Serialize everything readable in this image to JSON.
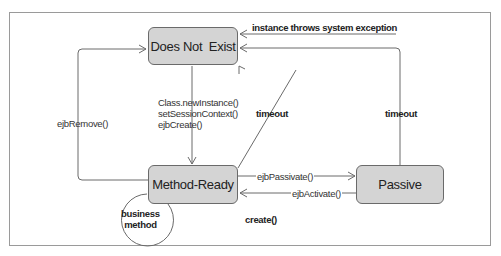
{
  "diagram": {
    "states": [
      {
        "id": "does_not_exist",
        "label": "Does Not  Exist"
      },
      {
        "id": "method_ready",
        "label": "Method-Ready"
      },
      {
        "id": "passive",
        "label": "Passive"
      }
    ],
    "transitions": {
      "create": "Class.newInstance()\nsetSessionContext()\nejbCreate()",
      "remove": "ejbRemove()",
      "timeout_ready": "timeout",
      "timeout_passive": "timeout",
      "exception": "instance throws system exception",
      "passivate": "ejbPassivate()",
      "activate": "ejbActivate()",
      "business": "business\nmethod",
      "create_call": "create()"
    },
    "colors": {
      "state_fill": "#d4d4d4",
      "state_border": "#6a6a6a",
      "line": "#6a6a6a",
      "frame": "#9a9a9a"
    }
  }
}
